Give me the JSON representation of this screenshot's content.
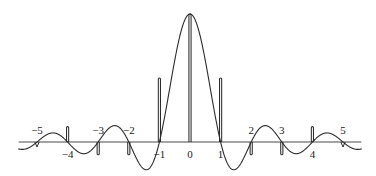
{
  "chart_data": {
    "type": "line",
    "title": "",
    "subtitle": "",
    "xlabel": "",
    "ylabel": "",
    "xlim": [
      -5.6,
      5.6
    ],
    "ylim": [
      -0.35,
      1.05
    ],
    "grid": false,
    "legend": null,
    "background": "#ffffff",
    "axis_color": "#4a4a4a",
    "curve_color": "#2b2b2b",
    "impulse_color": "#2b2b2b",
    "x_tick_values": [
      -5,
      -4,
      -3,
      -2,
      -1,
      0,
      1,
      2,
      3,
      4,
      5
    ],
    "x_tick_labels": [
      "−5",
      "−4",
      "−3",
      "−2",
      "−1",
      "0",
      "1",
      "2",
      "3",
      "4",
      "5"
    ],
    "x_tick_label_side": [
      "above",
      "below",
      "above",
      "above",
      "below",
      "below",
      "below",
      "above",
      "above",
      "below",
      "above"
    ],
    "series": [
      {
        "name": "sinc envelope",
        "type": "line",
        "x": [
          -5,
          -4.5,
          -4,
          -3.5,
          -3,
          -2.5,
          -2,
          -1.5,
          -1,
          -0.5,
          0,
          0.5,
          1,
          1.5,
          2,
          2.5,
          3,
          3.5,
          4,
          4.5,
          5
        ],
        "values": [
          0,
          0.1415,
          0,
          -0.1819,
          0,
          0.2546,
          0,
          -0.4244,
          0,
          0.6366,
          1,
          0.6366,
          0,
          -0.4244,
          0,
          0.2546,
          0,
          -0.1819,
          0,
          0.1415,
          0
        ]
      },
      {
        "name": "sample impulses",
        "type": "impulse",
        "x": [
          -5,
          -4,
          -3,
          -2,
          -1,
          0,
          1,
          2,
          3,
          4,
          5
        ],
        "values": [
          0,
          0.12,
          -0.1,
          -0.1,
          0.5,
          1.0,
          0.5,
          -0.1,
          -0.1,
          0.12,
          0
        ]
      }
    ]
  },
  "figure": {
    "caption": "",
    "impulse_half_width": 0.035
  }
}
